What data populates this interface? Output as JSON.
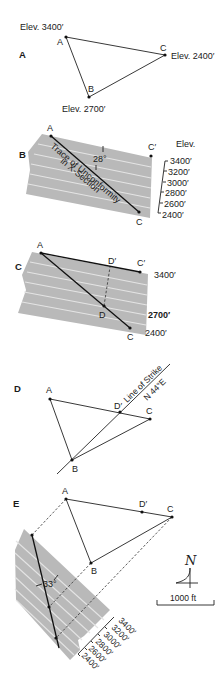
{
  "panels": {
    "A": {
      "label": "A",
      "points": {
        "A": "A",
        "B": "B",
        "C": "C"
      },
      "elev_A": "Elev. 3400′",
      "elev_B": "Elev. 2700′",
      "elev_C": "Elev. 2400′"
    },
    "B": {
      "label": "B",
      "point_A": "A",
      "point_C": "C",
      "point_Cp": "C′",
      "angle": "28°",
      "trace_line1": "Trace of Unconformity",
      "trace_line2": "in X-Section",
      "elev_title": "Elev.",
      "elevations": [
        "3400′",
        "3200′",
        "3000′",
        "2800′",
        "2600′",
        "2400′"
      ]
    },
    "C": {
      "label": "C",
      "point_A": "A",
      "point_C": "C",
      "point_Cp": "C′",
      "point_D": "D",
      "point_Dp": "D′",
      "elev_top": "3400′",
      "elev_mid": "2700′",
      "elev_bottom": "2400′"
    },
    "D": {
      "label": "D",
      "point_A": "A",
      "point_B": "B",
      "point_C": "C",
      "point_Dp": "D′",
      "strike_line1": "Line of Strike",
      "strike_line2": "N 44°E"
    },
    "E": {
      "label": "E",
      "point_A": "A",
      "point_B": "B",
      "point_C": "C",
      "point_Dp": "D′",
      "angle": "33°",
      "elevations": [
        "3400′",
        "3200′",
        "3000′",
        "2800′",
        "2600′",
        "2400′"
      ],
      "north_symbol": "N",
      "scale_label": "1000 ft"
    }
  }
}
